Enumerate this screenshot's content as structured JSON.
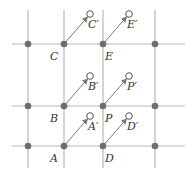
{
  "diagram": {
    "title": "",
    "colors": {
      "grid_line": "#b8b8b8",
      "dot_fill": "#6e6e6e",
      "arrow": "#777777",
      "open_circle_stroke": "#555555",
      "label": "#333333"
    },
    "grid": {
      "horizontal_y": [
        44,
        106,
        146
      ],
      "vertical_x": [
        28,
        64,
        103,
        155
      ],
      "x_range": [
        12,
        185
      ],
      "y_range": [
        10,
        168
      ]
    },
    "lattice_dots": [
      {
        "x": 28,
        "y": 44
      },
      {
        "x": 64,
        "y": 44
      },
      {
        "x": 103,
        "y": 44
      },
      {
        "x": 155,
        "y": 44
      },
      {
        "x": 28,
        "y": 106
      },
      {
        "x": 64,
        "y": 106
      },
      {
        "x": 103,
        "y": 106
      },
      {
        "x": 155,
        "y": 106
      },
      {
        "x": 28,
        "y": 146
      },
      {
        "x": 64,
        "y": 146
      },
      {
        "x": 103,
        "y": 146
      },
      {
        "x": 155,
        "y": 146
      }
    ],
    "translation_vector": {
      "dx": 26,
      "dy": -30
    },
    "points": [
      {
        "name": "A",
        "label": "A",
        "x": 64,
        "y": 146,
        "image_label": "A′",
        "ix": 90,
        "iy": 116
      },
      {
        "name": "D",
        "label": "D",
        "x": 103,
        "y": 146,
        "image_label": "D′",
        "ix": 129,
        "iy": 116
      },
      {
        "name": "B",
        "label": "B",
        "x": 64,
        "y": 106,
        "image_label": "B′",
        "ix": 90,
        "iy": 76
      },
      {
        "name": "P",
        "label": "P",
        "x": 103,
        "y": 106,
        "image_label": "P′",
        "ix": 129,
        "iy": 76
      },
      {
        "name": "C",
        "label": "C",
        "x": 64,
        "y": 44,
        "image_label": "C′",
        "ix": 90,
        "iy": 14
      },
      {
        "name": "E",
        "label": "E",
        "x": 103,
        "y": 44,
        "image_label": "E′",
        "ix": 129,
        "iy": 14
      }
    ]
  }
}
